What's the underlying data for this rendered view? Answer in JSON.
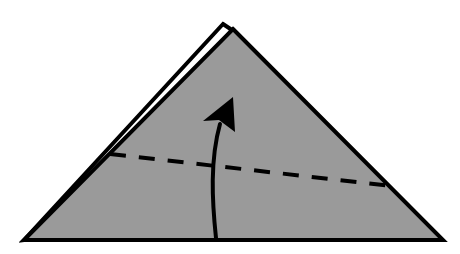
{
  "diagram": {
    "kind": "origami-fold-instruction",
    "colors": {
      "paper": "#9a9a9a",
      "paper_back": "#ffffff",
      "outline": "#000000",
      "background": "#ffffff"
    },
    "elements": {
      "paper_shape": "triangle",
      "back_layer": "offset triangle edge visible at top-left",
      "fold_line": "valley-fold (dashed)",
      "arrow": "curved fold-up arrow"
    }
  }
}
